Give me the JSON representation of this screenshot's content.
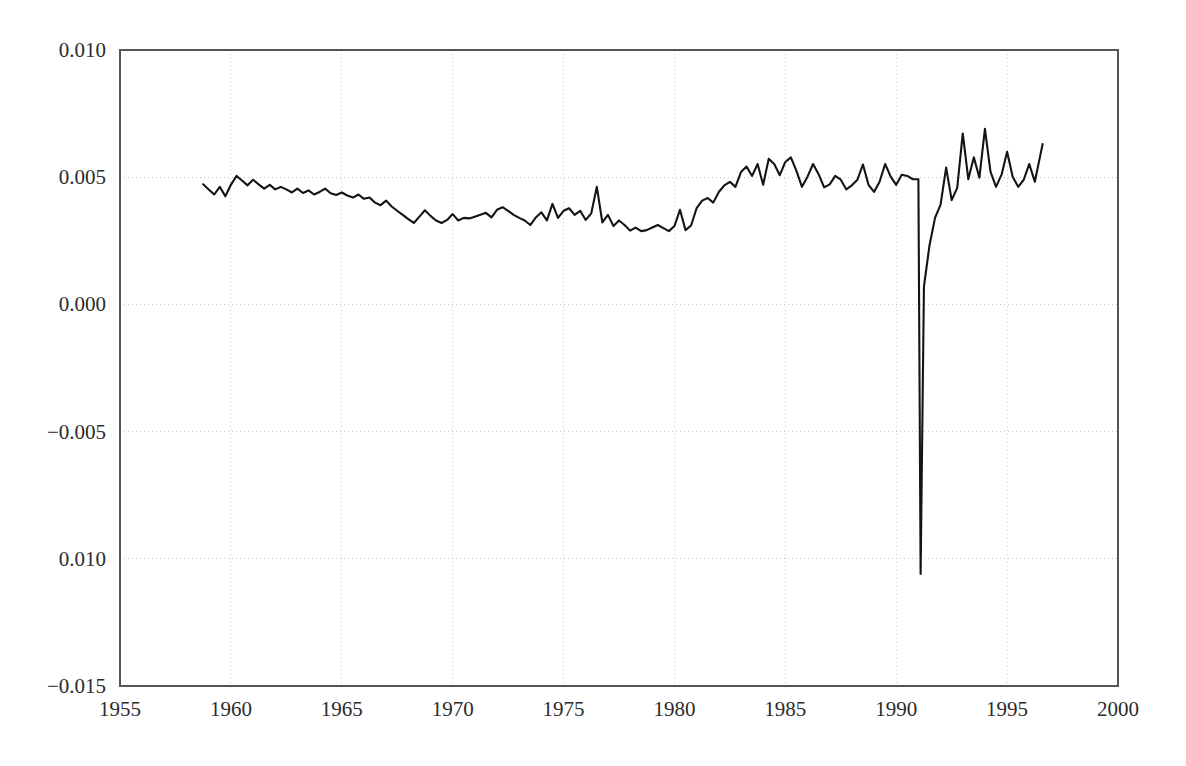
{
  "chart_data": {
    "type": "line",
    "title": "",
    "subtitle": "",
    "xlabel": "",
    "ylabel": "",
    "xlim": [
      1955,
      2000
    ],
    "ylim": [
      -0.015,
      0.01
    ],
    "grid": true,
    "legend": null,
    "legend_position": "none",
    "xticks": [
      1955,
      1960,
      1965,
      1970,
      1975,
      1980,
      1985,
      1990,
      1995,
      2000
    ],
    "xtick_labels": [
      "1955",
      "1960",
      "1965",
      "1970",
      "1975",
      "1980",
      "1985",
      "1990",
      "1995",
      "2000"
    ],
    "yticks": [
      0.01,
      0.005,
      0.0,
      -0.005,
      -0.01,
      -0.015
    ],
    "ytick_labels": [
      "0.010",
      "0.005",
      "0.000",
      "−0.005",
      "0.010",
      "−0.015"
    ],
    "series": [
      {
        "name": "series-1",
        "color": "#141414",
        "x": [
          1958.75,
          1959.0,
          1959.25,
          1959.5,
          1959.75,
          1960.0,
          1960.25,
          1960.5,
          1960.75,
          1961.0,
          1961.25,
          1961.5,
          1961.75,
          1962.0,
          1962.25,
          1962.5,
          1962.75,
          1963.0,
          1963.25,
          1963.5,
          1963.75,
          1964.0,
          1964.25,
          1964.5,
          1964.75,
          1965.0,
          1965.25,
          1965.5,
          1965.75,
          1966.0,
          1966.25,
          1966.5,
          1966.75,
          1967.0,
          1967.25,
          1967.5,
          1967.75,
          1968.0,
          1968.25,
          1968.5,
          1968.75,
          1969.0,
          1969.25,
          1969.5,
          1969.75,
          1970.0,
          1970.25,
          1970.5,
          1970.75,
          1971.0,
          1971.25,
          1971.5,
          1971.75,
          1972.0,
          1972.25,
          1972.5,
          1972.75,
          1973.0,
          1973.25,
          1973.5,
          1973.75,
          1974.0,
          1974.25,
          1974.5,
          1974.75,
          1975.0,
          1975.25,
          1975.5,
          1975.75,
          1976.0,
          1976.25,
          1976.5,
          1976.75,
          1977.0,
          1977.25,
          1977.5,
          1977.75,
          1978.0,
          1978.25,
          1978.5,
          1978.75,
          1979.0,
          1979.25,
          1979.5,
          1979.75,
          1980.0,
          1980.25,
          1980.5,
          1980.75,
          1981.0,
          1981.25,
          1981.5,
          1981.75,
          1982.0,
          1982.25,
          1982.5,
          1982.75,
          1983.0,
          1983.25,
          1983.5,
          1983.75,
          1984.0,
          1984.25,
          1984.5,
          1984.75,
          1985.0,
          1985.25,
          1985.5,
          1985.75,
          1986.0,
          1986.25,
          1986.5,
          1986.75,
          1987.0,
          1987.25,
          1987.5,
          1987.75,
          1988.0,
          1988.25,
          1988.5,
          1988.75,
          1989.0,
          1989.25,
          1989.5,
          1989.75,
          1990.0,
          1990.25,
          1990.5,
          1990.75,
          1991.0,
          1991.1,
          1991.25,
          1991.5,
          1991.75,
          1992.0,
          1992.25,
          1992.5,
          1992.75,
          1993.0,
          1993.25,
          1993.5,
          1993.75,
          1994.0,
          1994.25,
          1994.5,
          1994.75,
          1995.0,
          1995.25,
          1995.5,
          1995.75,
          1996.0,
          1996.25,
          1996.6
        ],
        "y": [
          0.00472,
          0.00452,
          0.00432,
          0.00462,
          0.00425,
          0.0047,
          0.00505,
          0.00487,
          0.00468,
          0.0049,
          0.00472,
          0.00455,
          0.0047,
          0.00452,
          0.00462,
          0.00452,
          0.0044,
          0.00455,
          0.00438,
          0.00448,
          0.00432,
          0.00442,
          0.00455,
          0.00437,
          0.0043,
          0.0044,
          0.00428,
          0.0042,
          0.00432,
          0.00415,
          0.0042,
          0.004,
          0.0039,
          0.00408,
          0.00385,
          0.00368,
          0.00352,
          0.00335,
          0.0032,
          0.00345,
          0.0037,
          0.00348,
          0.0033,
          0.0032,
          0.00332,
          0.00355,
          0.0033,
          0.0034,
          0.00338,
          0.00345,
          0.00352,
          0.0036,
          0.00342,
          0.00372,
          0.00382,
          0.00368,
          0.00352,
          0.0034,
          0.0033,
          0.00312,
          0.00342,
          0.00362,
          0.0033,
          0.00395,
          0.0034,
          0.00368,
          0.00378,
          0.00352,
          0.00368,
          0.00332,
          0.00358,
          0.00462,
          0.00322,
          0.00352,
          0.00308,
          0.0033,
          0.00312,
          0.0029,
          0.00302,
          0.00288,
          0.00292,
          0.00302,
          0.00312,
          0.003,
          0.00288,
          0.00308,
          0.00372,
          0.00292,
          0.0031,
          0.00378,
          0.00408,
          0.00418,
          0.004,
          0.00442,
          0.00468,
          0.00482,
          0.00462,
          0.0052,
          0.00542,
          0.00505,
          0.00552,
          0.0047,
          0.00572,
          0.00552,
          0.00508,
          0.0056,
          0.00578,
          0.00525,
          0.00462,
          0.00502,
          0.00552,
          0.00512,
          0.0046,
          0.00472,
          0.00505,
          0.0049,
          0.00452,
          0.00468,
          0.0049,
          0.0055,
          0.0047,
          0.00442,
          0.00482,
          0.00552,
          0.00502,
          0.0047,
          0.0051,
          0.00505,
          0.00492,
          0.00492,
          -0.0106,
          0.0007,
          0.00232,
          0.0034,
          0.00392,
          0.00538,
          0.0041,
          0.00458,
          0.00672,
          0.00492,
          0.00578,
          0.00498,
          0.0069,
          0.00522,
          0.00462,
          0.0051,
          0.006,
          0.00502,
          0.00462,
          0.0049,
          0.00552,
          0.00482,
          0.0063
        ]
      }
    ]
  },
  "axes": {
    "frame_color": "#555555",
    "grid_color": "#c8c8c8",
    "background_color": "#ffffff"
  }
}
